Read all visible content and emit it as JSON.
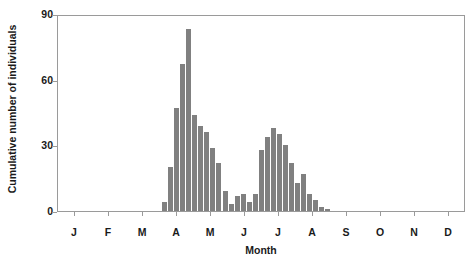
{
  "chart_data": {
    "type": "bar",
    "title": "",
    "subtitle": "",
    "xlabel": "Month",
    "ylabel": "Cumulative number of individuals",
    "ylim": [
      0,
      90
    ],
    "yticks": [
      0,
      30,
      60,
      90
    ],
    "ytick_labels": [
      "0",
      "30",
      "60",
      "90"
    ],
    "xtick_labels": [
      "J",
      "F",
      "M",
      "A",
      "M",
      "J",
      "J",
      "A",
      "S",
      "O",
      "N",
      "D"
    ],
    "xtick_full_names": [
      "January",
      "February",
      "March",
      "April",
      "May",
      "June",
      "July",
      "August",
      "September",
      "October",
      "November",
      "December"
    ],
    "grid": false,
    "legend": null,
    "bar_color": "#808080",
    "frame_color": "#9a9a9a",
    "x_is_weekly_bins": true,
    "x_bin_note": "Bars are sub-monthly (weekly) bins spanning the 12-month axis",
    "categories": [
      "A1",
      "A2",
      "A3",
      "A4",
      "M1",
      "M2",
      "M3",
      "M4",
      "J1",
      "J2",
      "J3",
      "J4",
      "Jy1",
      "Jy2",
      "Jy3",
      "Jy4",
      "A1b",
      "A2b",
      "A3b",
      "A4b",
      "S1",
      "S2",
      "S3",
      "S4",
      "O1",
      "O2",
      "O3",
      "O4"
    ],
    "values": [
      4,
      20,
      47,
      67,
      83,
      44,
      39,
      36,
      29,
      22,
      9,
      3,
      7,
      8,
      4,
      8,
      28,
      34,
      38,
      35,
      30,
      22,
      13,
      17,
      8,
      5,
      2,
      1
    ],
    "series": [
      {
        "name": "Cumulative number of individuals",
        "values": [
          4,
          20,
          47,
          67,
          83,
          44,
          39,
          36,
          29,
          22,
          9,
          3,
          7,
          8,
          4,
          8,
          28,
          34,
          38,
          35,
          30,
          22,
          13,
          17,
          8,
          5,
          2,
          1
        ]
      }
    ],
    "peaks": [
      {
        "label": "spring peak",
        "value": 83
      },
      {
        "label": "late-summer peak",
        "value": 38
      }
    ]
  }
}
